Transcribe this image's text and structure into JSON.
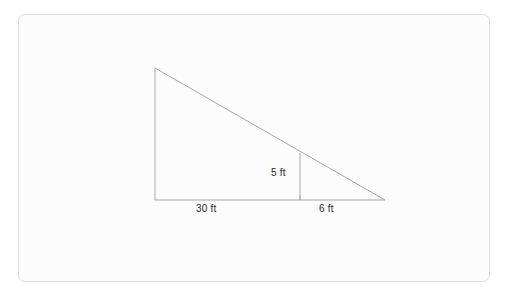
{
  "figure": {
    "frame": {
      "border_color": "#dcdcdc",
      "fill_color": "#fcfcfc"
    },
    "line_color": "#a8a8a8",
    "text_color": "#2b2b2b",
    "labels": {
      "base_left": "30 ft",
      "base_right": "6 ft",
      "height_small": "5 ft"
    },
    "geometry": {
      "apex": {
        "x": 155,
        "y": 68
      },
      "bottom_left": {
        "x": 155,
        "y": 200
      },
      "bottom_right": {
        "x": 385,
        "y": 200
      },
      "divider_top": {
        "x": 300,
        "y": 153
      },
      "divider_bottom": {
        "x": 300,
        "y": 200
      },
      "tick": {
        "x": 300,
        "y": 196
      }
    }
  }
}
